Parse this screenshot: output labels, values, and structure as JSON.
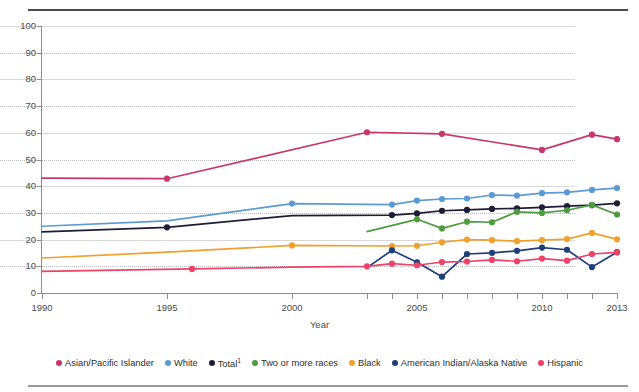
{
  "axis": {
    "x_title": "Year",
    "y_ticks": [
      0,
      10,
      20,
      30,
      40,
      50,
      60,
      70,
      80,
      90,
      100
    ],
    "x_ticks_labeled": [
      1990,
      1995,
      2000,
      2005,
      2010,
      2013
    ],
    "x_ticks_all": [
      1990,
      1995,
      2000,
      2003,
      2004,
      2005,
      2006,
      2007,
      2008,
      2009,
      2010,
      2011,
      2012,
      2013
    ]
  },
  "legend": {
    "items": [
      {
        "label": "Asian/Pacific Islander",
        "color": "#c8376b",
        "sup": ""
      },
      {
        "label": "White",
        "color": "#5b9bd5",
        "sup": ""
      },
      {
        "label": "Total",
        "color": "#1d1d37",
        "sup": "1"
      },
      {
        "label": "Two or more races",
        "color": "#4e9c3f",
        "sup": ""
      },
      {
        "label": "Black",
        "color": "#f0a02e",
        "sup": ""
      },
      {
        "label": "American Indian/Alaska Native",
        "color": "#1f3f7a",
        "sup": ""
      },
      {
        "label": "Hispanic",
        "color": "#ee4266",
        "sup": ""
      }
    ]
  },
  "chart_data": {
    "type": "line",
    "title": "",
    "xlabel": "Year",
    "ylabel": "",
    "xlim": [
      1990,
      2013
    ],
    "ylim": [
      0,
      100
    ],
    "grid": true,
    "legend_position": "bottom",
    "series": [
      {
        "name": "Asian/Pacific Islander",
        "color": "#c8376b",
        "points": [
          {
            "x": 1990,
            "y": 43.0,
            "marker": false
          },
          {
            "x": 1995,
            "y": 42.8,
            "marker": true
          },
          {
            "x": 2003,
            "y": 60.2,
            "marker": true
          },
          {
            "x": 2006,
            "y": 59.6,
            "marker": true
          },
          {
            "x": 2010,
            "y": 53.6,
            "marker": true
          },
          {
            "x": 2012,
            "y": 59.3,
            "marker": true
          },
          {
            "x": 2013,
            "y": 57.6,
            "marker": true
          }
        ]
      },
      {
        "name": "White",
        "color": "#5b9bd5",
        "points": [
          {
            "x": 1990,
            "y": 25.0,
            "marker": false
          },
          {
            "x": 1995,
            "y": 27.0,
            "marker": false
          },
          {
            "x": 2000,
            "y": 33.5,
            "marker": true
          },
          {
            "x": 2004,
            "y": 33.1,
            "marker": true
          },
          {
            "x": 2005,
            "y": 34.6,
            "marker": true
          },
          {
            "x": 2006,
            "y": 35.2,
            "marker": true
          },
          {
            "x": 2007,
            "y": 35.4,
            "marker": true
          },
          {
            "x": 2008,
            "y": 36.7,
            "marker": true
          },
          {
            "x": 2009,
            "y": 36.5,
            "marker": true
          },
          {
            "x": 2010,
            "y": 37.4,
            "marker": true
          },
          {
            "x": 2011,
            "y": 37.7,
            "marker": true
          },
          {
            "x": 2012,
            "y": 38.6,
            "marker": true
          },
          {
            "x": 2013,
            "y": 39.3,
            "marker": true
          }
        ]
      },
      {
        "name": "Total",
        "color": "#1d1d37",
        "points": [
          {
            "x": 1990,
            "y": 22.9,
            "marker": false
          },
          {
            "x": 1995,
            "y": 24.6,
            "marker": true
          },
          {
            "x": 2000,
            "y": 29.0,
            "marker": false
          },
          {
            "x": 2004,
            "y": 29.2,
            "marker": true
          },
          {
            "x": 2005,
            "y": 29.8,
            "marker": true
          },
          {
            "x": 2006,
            "y": 30.8,
            "marker": true
          },
          {
            "x": 2007,
            "y": 31.1,
            "marker": true
          },
          {
            "x": 2008,
            "y": 31.5,
            "marker": true
          },
          {
            "x": 2009,
            "y": 31.7,
            "marker": true
          },
          {
            "x": 2010,
            "y": 32.1,
            "marker": true
          },
          {
            "x": 2011,
            "y": 32.5,
            "marker": true
          },
          {
            "x": 2012,
            "y": 32.9,
            "marker": true
          },
          {
            "x": 2013,
            "y": 33.6,
            "marker": true
          }
        ]
      },
      {
        "name": "Two or more races",
        "color": "#4e9c3f",
        "points": [
          {
            "x": 2003,
            "y": 23.0,
            "marker": false
          },
          {
            "x": 2005,
            "y": 27.6,
            "marker": true
          },
          {
            "x": 2006,
            "y": 24.2,
            "marker": true
          },
          {
            "x": 2007,
            "y": 26.7,
            "marker": true
          },
          {
            "x": 2008,
            "y": 26.5,
            "marker": true
          },
          {
            "x": 2009,
            "y": 30.4,
            "marker": true
          },
          {
            "x": 2010,
            "y": 30.0,
            "marker": true
          },
          {
            "x": 2011,
            "y": 31.0,
            "marker": true
          },
          {
            "x": 2012,
            "y": 33.0,
            "marker": true
          },
          {
            "x": 2013,
            "y": 29.4,
            "marker": true
          }
        ]
      },
      {
        "name": "Black",
        "color": "#f0a02e",
        "points": [
          {
            "x": 1990,
            "y": 13.1,
            "marker": false
          },
          {
            "x": 1995,
            "y": 15.3,
            "marker": false
          },
          {
            "x": 2000,
            "y": 17.8,
            "marker": true
          },
          {
            "x": 2004,
            "y": 17.6,
            "marker": true
          },
          {
            "x": 2005,
            "y": 17.7,
            "marker": true
          },
          {
            "x": 2006,
            "y": 19.0,
            "marker": true
          },
          {
            "x": 2007,
            "y": 20.0,
            "marker": true
          },
          {
            "x": 2008,
            "y": 19.8,
            "marker": true
          },
          {
            "x": 2009,
            "y": 19.4,
            "marker": true
          },
          {
            "x": 2010,
            "y": 19.8,
            "marker": true
          },
          {
            "x": 2011,
            "y": 20.2,
            "marker": true
          },
          {
            "x": 2012,
            "y": 22.5,
            "marker": true
          },
          {
            "x": 2013,
            "y": 20.1,
            "marker": true
          }
        ]
      },
      {
        "name": "American Indian/Alaska Native",
        "color": "#1f3f7a",
        "points": [
          {
            "x": 2003,
            "y": 9.5,
            "marker": false
          },
          {
            "x": 2004,
            "y": 16.0,
            "marker": true
          },
          {
            "x": 2005,
            "y": 11.5,
            "marker": true
          },
          {
            "x": 2006,
            "y": 6.1,
            "marker": true
          },
          {
            "x": 2007,
            "y": 14.6,
            "marker": true
          },
          {
            "x": 2008,
            "y": 15.0,
            "marker": true
          },
          {
            "x": 2009,
            "y": 15.8,
            "marker": true
          },
          {
            "x": 2010,
            "y": 17.0,
            "marker": true
          },
          {
            "x": 2011,
            "y": 16.2,
            "marker": true
          },
          {
            "x": 2012,
            "y": 9.7,
            "marker": true
          },
          {
            "x": 2013,
            "y": 15.3,
            "marker": true
          }
        ]
      },
      {
        "name": "Hispanic",
        "color": "#ee4266",
        "points": [
          {
            "x": 1990,
            "y": 8.1,
            "marker": false
          },
          {
            "x": 1996,
            "y": 9.0,
            "marker": true
          },
          {
            "x": 2000,
            "y": 9.7,
            "marker": false
          },
          {
            "x": 2003,
            "y": 10.0,
            "marker": true
          },
          {
            "x": 2004,
            "y": 11.0,
            "marker": true
          },
          {
            "x": 2005,
            "y": 10.4,
            "marker": true
          },
          {
            "x": 2006,
            "y": 11.6,
            "marker": true
          },
          {
            "x": 2007,
            "y": 11.8,
            "marker": true
          },
          {
            "x": 2008,
            "y": 12.4,
            "marker": true
          },
          {
            "x": 2009,
            "y": 11.9,
            "marker": true
          },
          {
            "x": 2010,
            "y": 12.9,
            "marker": true
          },
          {
            "x": 2011,
            "y": 12.1,
            "marker": true
          },
          {
            "x": 2012,
            "y": 14.6,
            "marker": true
          },
          {
            "x": 2013,
            "y": 15.2,
            "marker": true
          }
        ]
      }
    ]
  }
}
